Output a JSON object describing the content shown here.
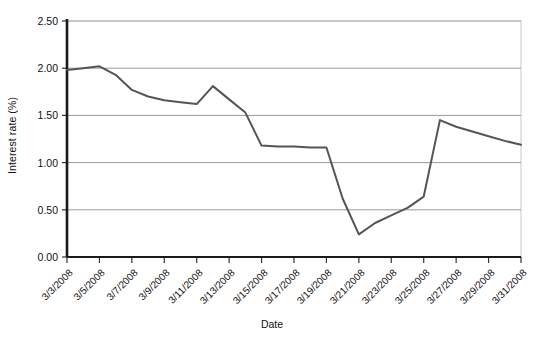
{
  "chart_data": {
    "type": "line",
    "title": "",
    "xlabel": "Date",
    "ylabel": "Interest rate (%)",
    "ylim": [
      0.0,
      2.5
    ],
    "ytick_labels": [
      "0.00",
      "0.50",
      "1.00",
      "1.50",
      "2.00",
      "2.50"
    ],
    "ytick_values": [
      0.0,
      0.5,
      1.0,
      1.5,
      2.0,
      2.5
    ],
    "grid": "horizontal",
    "legend": "none",
    "line_color": "#555555",
    "categories": [
      "3/3/2008",
      "3/4/2008",
      "3/5/2008",
      "3/6/2008",
      "3/7/2008",
      "3/8/2008",
      "3/9/2008",
      "3/10/2008",
      "3/11/2008",
      "3/12/2008",
      "3/13/2008",
      "3/14/2008",
      "3/15/2008",
      "3/16/2008",
      "3/17/2008",
      "3/18/2008",
      "3/19/2008",
      "3/20/2008",
      "3/21/2008",
      "3/22/2008",
      "3/23/2008",
      "3/24/2008",
      "3/25/2008",
      "3/26/2008",
      "3/27/2008",
      "3/28/2008",
      "3/29/2008",
      "3/30/2008",
      "3/31/2008"
    ],
    "xtick_labels": [
      "3/3/2008",
      "3/5/2008",
      "3/7/2008",
      "3/9/2008",
      "3/11/2008",
      "3/13/2008",
      "3/15/2008",
      "3/17/2008",
      "3/19/2008",
      "3/21/2008",
      "3/23/2008",
      "3/25/2008",
      "3/27/2008",
      "3/29/2008",
      "3/31/2008"
    ],
    "series": [
      {
        "name": "Interest rate",
        "values": [
          1.98,
          2.0,
          2.02,
          1.93,
          1.77,
          1.7,
          1.66,
          1.64,
          1.62,
          1.81,
          1.67,
          1.53,
          1.18,
          1.17,
          1.17,
          1.16,
          1.16,
          0.62,
          0.24,
          0.36,
          0.44,
          0.52,
          0.64,
          1.45,
          1.38,
          1.33,
          1.28,
          1.23,
          1.19
        ]
      }
    ]
  }
}
